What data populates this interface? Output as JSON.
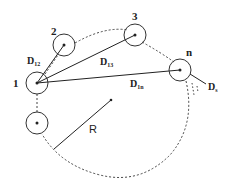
{
  "diagram": {
    "nodes": [
      {
        "id": "1",
        "label": "1"
      },
      {
        "id": "2",
        "label": "2"
      },
      {
        "id": "3",
        "label": "3"
      },
      {
        "id": "n",
        "label": "n"
      },
      {
        "id": "unlabeled",
        "label": ""
      }
    ],
    "distances": [
      {
        "main": "D",
        "sub": "12"
      },
      {
        "main": "D",
        "sub": "13"
      },
      {
        "main": "D",
        "sub": "1n"
      },
      {
        "main": "D",
        "sub": "s"
      }
    ],
    "radius_label": "R",
    "colors": {
      "stroke": "#222222",
      "background": "#ffffff"
    }
  }
}
